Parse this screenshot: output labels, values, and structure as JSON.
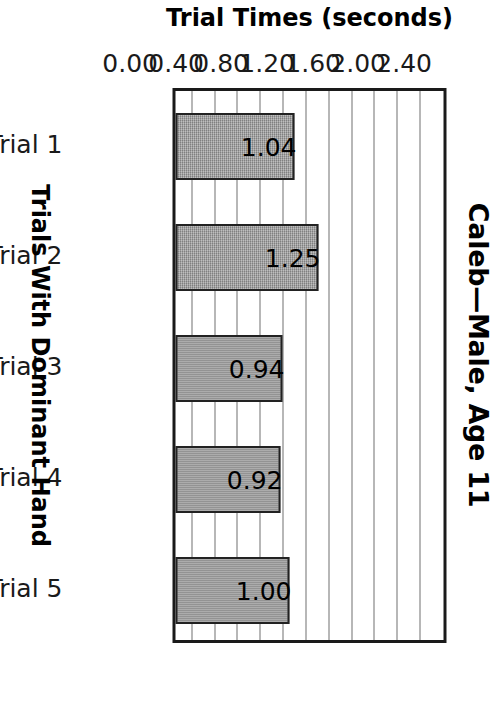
{
  "chart_data": {
    "type": "bar",
    "title": "Caleb—Male, Age 11",
    "categories": [
      "Trial 1",
      "Trial 2",
      "Trial 3",
      "Trial 4",
      "Trial 5"
    ],
    "values": [
      1.04,
      1.25,
      0.94,
      0.92,
      1.0
    ],
    "data_labels": [
      "1.04",
      "1.25",
      "0.94",
      "0.92",
      "1.00"
    ],
    "xlabel": "Trials With Dominant Hand",
    "ylabel": "Trial Times (seconds)",
    "ylim": [
      0.0,
      2.4
    ],
    "ytick_labels": [
      "0.00",
      "0.40",
      "0.80",
      "1.20",
      "1.60",
      "2.00",
      "2.40"
    ],
    "ytick_values": [
      0.0,
      0.4,
      0.8,
      1.2,
      1.6,
      2.0,
      2.4
    ],
    "gridline_values": [
      0.2,
      0.4,
      0.6,
      0.8,
      1.0,
      1.2,
      1.4,
      1.6,
      1.8,
      2.0,
      2.2
    ],
    "grid": true,
    "legend": false,
    "legend_position": "none",
    "orientation": "vertical-bars",
    "page_rotation_degrees": 90,
    "bar_fill_color": "#9a9a9a",
    "bar_border_color": "#222222",
    "gridline_color": "#707070",
    "plot_border_color": "#1a1a1a",
    "text_color": "#000000",
    "background_color": "#ffffff"
  }
}
